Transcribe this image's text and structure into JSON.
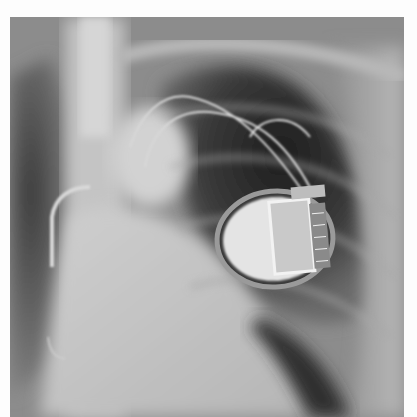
{
  "image": {
    "subject": "Chest X-ray with implanted cardiac device",
    "alt": "Frontal chest radiograph showing an implanted pacemaker/ICD generator over the left upper chest with leads, and a curved catheter/lead on the right side"
  },
  "colors": {
    "page_background": "#fdfdfd",
    "lung_dark": "#2a2a2a",
    "soft_tissue": "#9a9a9a",
    "bone_bright": "#d8d8d8",
    "device_bright": "#e6e6e6"
  }
}
